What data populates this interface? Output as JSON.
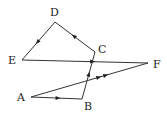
{
  "diagram": {
    "type": "directed-graph",
    "stroke_color": "#333333",
    "points": {
      "A": {
        "label": "A",
        "x": 31,
        "y": 97,
        "lx": 17,
        "ly": 101
      },
      "B": {
        "label": "B",
        "x": 82,
        "y": 99,
        "lx": 84,
        "ly": 110
      },
      "C": {
        "label": "C",
        "x": 95,
        "y": 52,
        "lx": 98,
        "ly": 53
      },
      "D": {
        "label": "D",
        "x": 55,
        "y": 22,
        "lx": 50,
        "ly": 16
      },
      "E": {
        "label": "E",
        "x": 22,
        "y": 60,
        "lx": 8,
        "ly": 64
      },
      "F": {
        "label": "F",
        "x": 148,
        "y": 63,
        "lx": 153,
        "ly": 68
      }
    },
    "edges": [
      {
        "from": "A",
        "to": "B",
        "arrows": 1
      },
      {
        "from": "B",
        "to": "C",
        "arrows": 1
      },
      {
        "from": "C",
        "to": "D",
        "arrows": 1
      },
      {
        "from": "D",
        "to": "E",
        "arrows": 1
      },
      {
        "from": "E",
        "to": "F",
        "arrows": 1
      },
      {
        "from": "A",
        "to": "F",
        "arrows": 2
      }
    ]
  }
}
